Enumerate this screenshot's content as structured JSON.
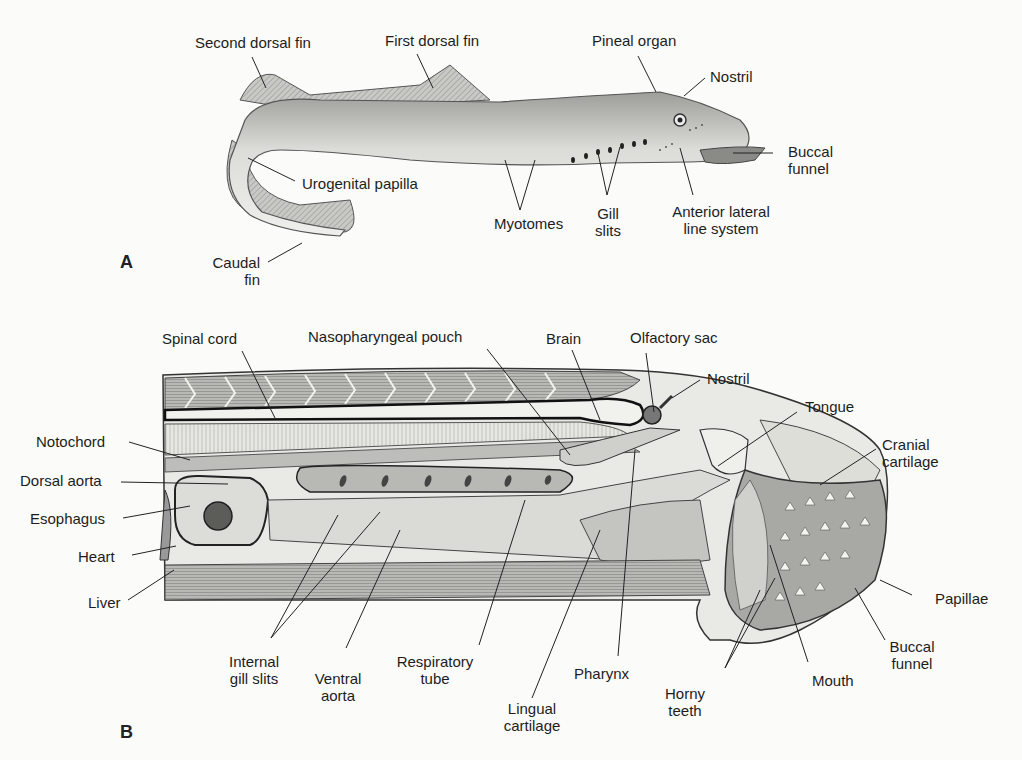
{
  "figure": {
    "panel_a": {
      "id": "A",
      "labels": {
        "second_dorsal_fin": "Second dorsal fin",
        "first_dorsal_fin": "First dorsal fin",
        "pineal_organ": "Pineal organ",
        "nostril": "Nostril",
        "buccal_funnel_1": "Buccal",
        "buccal_funnel_2": "funnel",
        "urogenital_papilla": "Urogenital papilla",
        "myotomes": "Myotomes",
        "gill_slits_1": "Gill",
        "gill_slits_2": "slits",
        "anterior_lateral_1": "Anterior lateral",
        "anterior_lateral_2": "line system",
        "caudal_fin_1": "Caudal",
        "caudal_fin_2": "fin"
      }
    },
    "panel_b": {
      "id": "B",
      "labels": {
        "spinal_cord": "Spinal cord",
        "nasopharyngeal_pouch": "Nasopharyngeal pouch",
        "brain": "Brain",
        "olfactory_sac": "Olfactory sac",
        "nostril": "Nostril",
        "tongue": "Tongue",
        "cranial_cartilage_1": "Cranial",
        "cranial_cartilage_2": "cartilage",
        "notochord": "Notochord",
        "dorsal_aorta": "Dorsal aorta",
        "esophagus": "Esophagus",
        "heart": "Heart",
        "liver": "Liver",
        "papillae": "Papillae",
        "buccal_funnel_1": "Buccal",
        "buccal_funnel_2": "funnel",
        "internal_gill_slits_1": "Internal",
        "internal_gill_slits_2": "gill slits",
        "ventral_aorta_1": "Ventral",
        "ventral_aorta_2": "aorta",
        "respiratory_tube_1": "Respiratory",
        "respiratory_tube_2": "tube",
        "pharynx": "Pharynx",
        "lingual_cartilage_1": "Lingual",
        "lingual_cartilage_2": "cartilage",
        "horny_teeth_1": "Horny",
        "horny_teeth_2": "teeth",
        "mouth": "Mouth"
      }
    }
  }
}
